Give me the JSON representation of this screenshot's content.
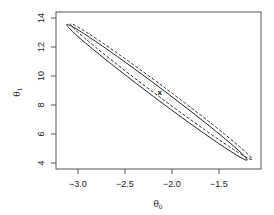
{
  "chart_data": {
    "type": "line",
    "title": "",
    "xlabel": "θ0",
    "ylabel": "θ1",
    "xlim": [
      -3.25,
      -1.05
    ],
    "ylim": [
      3.6,
      14.4
    ],
    "xticks": [
      -3.0,
      -2.5,
      -2.0,
      -1.5
    ],
    "xtick_labels": [
      "-3.0",
      "-2.5",
      "-2.0",
      "-1.5"
    ],
    "yticks": [
      4,
      6,
      8,
      10,
      12,
      14
    ],
    "ytick_labels": [
      "4",
      "6",
      "8",
      "10",
      "12",
      "14"
    ],
    "grid": false,
    "legend": null,
    "center_marker": {
      "label": "x",
      "x": -2.13,
      "y": 8.83
    },
    "series": [
      {
        "name": "solid-ellipse",
        "style": "solid",
        "shape": "ellipse",
        "center": [
          -2.13,
          8.83
        ],
        "tips": [
          [
            -3.12,
            13.55
          ],
          [
            -1.2,
            4.2
          ]
        ],
        "half_width": 0.52
      },
      {
        "name": "dashed-contour",
        "style": "dashed",
        "shape": "ellipse",
        "center": [
          -2.14,
          8.85
        ],
        "tips": [
          [
            -3.08,
            13.6
          ],
          [
            -1.15,
            4.25
          ]
        ],
        "half_width": 0.5
      }
    ]
  },
  "axes": {
    "x_label_main": "θ",
    "x_label_sub": "0",
    "y_label_main": "θ",
    "y_label_sub": "1"
  }
}
